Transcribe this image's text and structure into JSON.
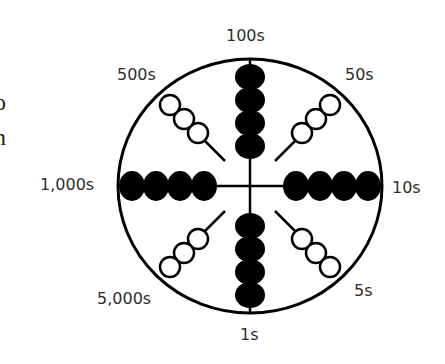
{
  "edge_text": [
    "o",
    "n",
    ""
  ],
  "diagram": {
    "type": "abacus-wheel",
    "labels": {
      "top": "100s",
      "top_right": "50s",
      "right": "10s",
      "bottom_right": "5s",
      "bottom": "1s",
      "bottom_left": "5,000s",
      "left": "1,000s",
      "top_left": "500s"
    },
    "cardinal_beads": 4,
    "diagonal_beads": 3,
    "colors": {
      "stroke": "#000000",
      "fill_bead": "#000000",
      "open_bead": "#ffffff",
      "label": "#2e2e2e"
    }
  }
}
